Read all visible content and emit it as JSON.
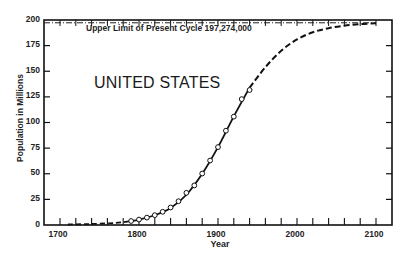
{
  "chart_data": {
    "type": "line",
    "title": "UNITED STATES",
    "xlabel": "Year",
    "ylabel": "Population in Millions",
    "xlim": [
      1680,
      2120
    ],
    "ylim": [
      0,
      200
    ],
    "x_ticks": [
      1700,
      1800,
      1900,
      2000,
      2100
    ],
    "y_ticks": [
      0,
      25,
      50,
      75,
      100,
      125,
      150,
      175,
      200
    ],
    "grid": false,
    "annotations": [
      {
        "text": "Upper Limit of Present Cycle 197,274,000",
        "value": 197.274,
        "style": "dash-dot"
      }
    ],
    "series": [
      {
        "name": "Census observations",
        "style": "open-circles",
        "x": [
          1790,
          1800,
          1810,
          1820,
          1830,
          1840,
          1850,
          1860,
          1870,
          1880,
          1890,
          1900,
          1910,
          1920,
          1930,
          1940
        ],
        "values": [
          3.9,
          5.3,
          7.2,
          9.6,
          12.9,
          17.1,
          23.2,
          31.4,
          38.6,
          50.2,
          62.9,
          76.0,
          92.0,
          105.7,
          122.8,
          131.7
        ]
      },
      {
        "name": "Logistic curve (fitted)",
        "style": "solid",
        "x": [
          1790,
          1800,
          1820,
          1840,
          1860,
          1880,
          1900,
          1920,
          1940
        ],
        "values": [
          3.9,
          5.3,
          9.5,
          16.5,
          29.5,
          50,
          76,
          106,
          134
        ]
      },
      {
        "name": "Logistic curve (extrapolated)",
        "style": "dashed",
        "x": [
          1710,
          1740,
          1770,
          1790,
          1940,
          1960,
          1980,
          2000,
          2020,
          2040,
          2060,
          2080,
          2100
        ],
        "values": [
          0.5,
          1.0,
          2.0,
          3.9,
          134,
          154,
          170,
          181,
          188,
          192,
          194.5,
          196,
          196.8
        ]
      }
    ]
  },
  "labels": {
    "title": "UNITED STATES",
    "annotation": "Upper Limit of Present Cycle 197,274,000",
    "xlabel": "Year",
    "ylabel": "Population in Millions",
    "yticks": [
      "200",
      "175",
      "150",
      "125",
      "100",
      "75",
      "50",
      "25",
      "0"
    ],
    "xticks": [
      "1700",
      "1800",
      "1900",
      "2000",
      "2100"
    ]
  }
}
